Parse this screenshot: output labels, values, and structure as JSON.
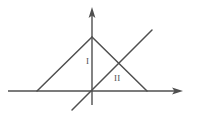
{
  "figure": {
    "type": "geometric-line-diagram",
    "width": 197,
    "height": 119,
    "background_color": "#ffffff",
    "stroke_color": "#4f4f4f",
    "stroke_width": 1.4
  },
  "axes": {
    "x_axis": {
      "name": "x-axis",
      "from": [
        8,
        91
      ],
      "to": [
        183,
        91
      ],
      "arrow": "right",
      "arrow_tip": [
        183,
        91
      ]
    },
    "y_axis": {
      "name": "y-axis",
      "from": [
        92,
        105
      ],
      "to": [
        92,
        7
      ],
      "arrow": "up",
      "arrow_tip": [
        92,
        7
      ]
    },
    "origin": [
      92,
      91
    ]
  },
  "shapes": [
    {
      "name": "triangle-left-side",
      "kind": "segment",
      "from": [
        37,
        91
      ],
      "to": [
        92,
        37
      ]
    },
    {
      "name": "triangle-right-side",
      "kind": "segment",
      "from": [
        92,
        37
      ],
      "to": [
        147,
        91
      ]
    },
    {
      "name": "rising-diagonal-line",
      "kind": "segment",
      "from": [
        72,
        110
      ],
      "to": [
        152,
        30
      ]
    }
  ],
  "points": {
    "apex": [
      92,
      37
    ],
    "triangle_left_foot": [
      37,
      91
    ],
    "triangle_right_foot": [
      147,
      91
    ],
    "diagonal_lower_end": [
      72,
      110
    ],
    "diagonal_upper_end": [
      152,
      30
    ],
    "diagonal_crosses_right_side_at": [
      131,
      76
    ]
  },
  "labels": [
    {
      "name": "region-label-I",
      "text": "I",
      "x": 86,
      "y": 57,
      "font_size": 9
    },
    {
      "name": "region-label-II",
      "text": "II",
      "x": 114,
      "y": 74,
      "font_size": 9
    }
  ]
}
